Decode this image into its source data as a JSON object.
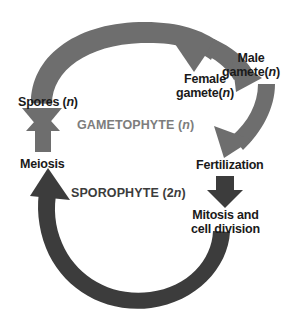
{
  "diagram": {
    "background_color": "#ffffff",
    "gametophyte_arrow_color": "#6e6e6e",
    "sporophyte_arrow_color": "#3c3c3c",
    "text_color": "#1a1a1a"
  },
  "phases": {
    "gametophyte": {
      "label": "GAMETOPHYTE (",
      "ploidy": "n",
      "close": ")",
      "color": "#7d7d7d"
    },
    "sporophyte": {
      "label": "SPOROPHYTE (2",
      "ploidy": "n",
      "close": ")",
      "color": "#3c3c3c"
    }
  },
  "nodes": {
    "male_gamete": {
      "line1": "Male",
      "line2": "gamete(",
      "ploidy": "n",
      "close": ")"
    },
    "female_gamete": {
      "line1": "Female",
      "line2": "gamete(",
      "ploidy": "n",
      "close": ")"
    },
    "spores": {
      "label": "Spores (",
      "ploidy": "n",
      "close": ")"
    },
    "meiosis": {
      "label": "Meiosis"
    },
    "fertilization": {
      "label": "Fertilization"
    },
    "mitosis": {
      "line1": "Mitosis and",
      "line2": "cell division"
    }
  },
  "arrows": {
    "gametophyte_arc": "spores-to-gametes-arc",
    "gamete_down_arrow": "gametes-to-fertilization-arrow",
    "fertilization_arrow": "fertilization-to-mitosis-arrow",
    "sporophyte_arc": "mitosis-to-meiosis-arc",
    "meiosis_arrow": "meiosis-to-spores-arrow"
  }
}
